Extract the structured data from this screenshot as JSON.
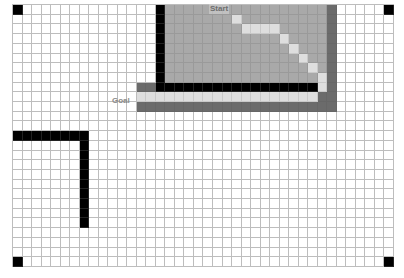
{
  "diagram": {
    "type": "grid-pathfinding",
    "columns": 40,
    "rows": 27,
    "labels": {
      "start": "Start",
      "goal": "Goal"
    },
    "colors": {
      "empty": "#ffffff",
      "wall": "#000000",
      "explored": "#a9a9a9",
      "frontier": "#6b6b6b",
      "path": "#dedede",
      "grid_line": "#bdbdbd"
    },
    "corner_markers": [
      [
        0,
        0
      ],
      [
        39,
        0
      ],
      [
        0,
        26
      ],
      [
        39,
        26
      ]
    ],
    "walls": [
      {
        "col": 15,
        "rows": [
          0,
          8
        ]
      },
      {
        "row": 8,
        "cols": [
          15,
          31
        ]
      },
      {
        "row": 13,
        "cols": [
          0,
          7
        ]
      },
      {
        "col": 7,
        "rows": [
          13,
          22
        ]
      }
    ],
    "explored_region": {
      "cols": [
        16,
        32
      ],
      "rows": [
        0,
        7
      ]
    },
    "frontier_cells": [
      {
        "col": 33,
        "rows": [
          0,
          10
        ]
      },
      {
        "row": 8,
        "cols": [
          13,
          14
        ]
      },
      {
        "row": 10,
        "cols": [
          13,
          33
        ]
      },
      {
        "row": 9,
        "cols": [
          32,
          32
        ]
      }
    ],
    "path_cells": [
      [
        23,
        1
      ],
      [
        24,
        2
      ],
      [
        25,
        2
      ],
      [
        26,
        2
      ],
      [
        27,
        2
      ],
      [
        28,
        3
      ],
      [
        29,
        4
      ],
      [
        30,
        5
      ],
      [
        31,
        6
      ],
      [
        32,
        7
      ],
      [
        32,
        8
      ],
      [
        31,
        9
      ],
      [
        30,
        9
      ],
      [
        29,
        9
      ],
      [
        28,
        9
      ],
      [
        27,
        9
      ],
      [
        26,
        9
      ],
      [
        25,
        9
      ],
      [
        24,
        9
      ],
      [
        23,
        9
      ],
      [
        22,
        9
      ],
      [
        21,
        9
      ],
      [
        20,
        9
      ],
      [
        19,
        9
      ],
      [
        18,
        9
      ],
      [
        17,
        9
      ],
      [
        16,
        9
      ],
      [
        15,
        9
      ],
      [
        14,
        9
      ],
      [
        13,
        9
      ]
    ],
    "start_cell": [
      21,
      0
    ],
    "goal_cell": [
      13,
      9
    ]
  }
}
